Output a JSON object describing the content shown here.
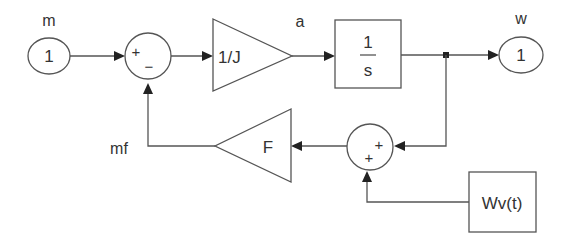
{
  "diagram": {
    "type": "block-diagram",
    "colors": {
      "line": "#555555",
      "arrow": "#222222",
      "text": "#333333",
      "background": "#ffffff"
    },
    "signals": {
      "input": "m",
      "accel": "a",
      "output": "w",
      "feedback": "mf"
    },
    "blocks": {
      "inport": {
        "label": "1"
      },
      "sum1": {
        "sign_top": "+",
        "sign_bottom": "−"
      },
      "gain_inertia": {
        "label": "1/J"
      },
      "integrator": {
        "numerator": "1",
        "denominator": "s"
      },
      "outport": {
        "label": "1"
      },
      "sum2": {
        "sign_right": "+",
        "sign_bottom": "+"
      },
      "gain_friction": {
        "label": "F"
      },
      "disturbance": {
        "label": "Wv(t)"
      }
    }
  }
}
